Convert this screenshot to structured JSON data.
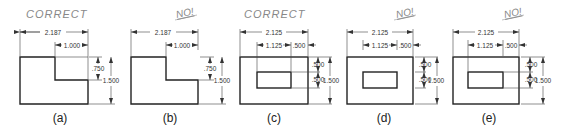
{
  "figures": [
    {
      "id": "a",
      "verdict": "CORRECT",
      "label": "(a)",
      "dims": {
        "overall_width": "2.187",
        "notch_width": "1.000",
        "notch_depth": ".750",
        "height": "1.500"
      }
    },
    {
      "id": "b",
      "verdict": "NO!",
      "label": "(b)",
      "dims": {
        "overall_width": "2.187",
        "notch_width": "1.000",
        "notch_depth": ".750",
        "height": "1.500"
      }
    },
    {
      "id": "c",
      "verdict": "CORRECT",
      "label": "(c)",
      "dims": {
        "overall_width": "2.125",
        "hole_width": "1.125",
        "hole_offset_x": ".500",
        "hole_offset_y_top": ".500",
        "hole_height": ".500",
        "height": "1.500"
      }
    },
    {
      "id": "d",
      "verdict": "NO!",
      "label": "(d)",
      "dims": {
        "overall_width": "2.125",
        "hole_width": "1.125",
        "hole_offset_x": ".500",
        "hole_offset_y_top": ".500",
        "hole_height": ".500",
        "height": "1.500"
      }
    },
    {
      "id": "e",
      "verdict": "NO!",
      "label": "(e)",
      "dims": {
        "overall_width": "2.125",
        "hole_width": "1.125",
        "hole_offset_x": ".500",
        "hole_offset_y_top": ".500",
        "hole_height": ".500",
        "height": "1.500"
      }
    }
  ]
}
